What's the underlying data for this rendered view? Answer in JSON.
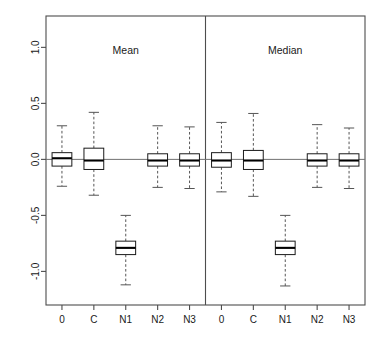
{
  "chart_data": {
    "type": "box",
    "title": "",
    "subtitle": "",
    "xlabel": "",
    "ylabel": "",
    "ylim": [
      -1.3,
      1.28
    ],
    "yticks": [
      1.0,
      0.5,
      0.0,
      -0.5,
      -1.0
    ],
    "ytick_labels": [
      "1.0",
      "0.5",
      "0.0",
      "-0.5",
      "-1.0"
    ],
    "grid": false,
    "legend": "none",
    "reference_line_y": 0.0,
    "panels": [
      {
        "label": "Mean",
        "categories": [
          "0",
          "C",
          "N1",
          "N2",
          "N3"
        ],
        "boxes": [
          {
            "category": "0",
            "whisker_low": -0.24,
            "q1": -0.06,
            "median": 0.01,
            "q3": 0.06,
            "whisker_high": 0.3
          },
          {
            "category": "C",
            "whisker_low": -0.32,
            "q1": -0.09,
            "median": -0.01,
            "q3": 0.1,
            "whisker_high": 0.42
          },
          {
            "category": "N1",
            "whisker_low": -1.12,
            "q1": -0.85,
            "median": -0.79,
            "q3": -0.73,
            "whisker_high": -0.5
          },
          {
            "category": "N2",
            "whisker_low": -0.25,
            "q1": -0.06,
            "median": -0.01,
            "q3": 0.05,
            "whisker_high": 0.3
          },
          {
            "category": "N3",
            "whisker_low": -0.26,
            "q1": -0.06,
            "median": -0.01,
            "q3": 0.05,
            "whisker_high": 0.29
          }
        ]
      },
      {
        "label": "Median",
        "categories": [
          "0",
          "C",
          "N1",
          "N2",
          "N3"
        ],
        "boxes": [
          {
            "category": "0",
            "whisker_low": -0.29,
            "q1": -0.07,
            "median": -0.01,
            "q3": 0.06,
            "whisker_high": 0.33
          },
          {
            "category": "C",
            "whisker_low": -0.33,
            "q1": -0.09,
            "median": -0.01,
            "q3": 0.08,
            "whisker_high": 0.41
          },
          {
            "category": "N1",
            "whisker_low": -1.13,
            "q1": -0.85,
            "median": -0.79,
            "q3": -0.73,
            "whisker_high": -0.5
          },
          {
            "category": "N2",
            "whisker_low": -0.25,
            "q1": -0.06,
            "median": -0.01,
            "q3": 0.05,
            "whisker_high": 0.31
          },
          {
            "category": "N3",
            "whisker_low": -0.26,
            "q1": -0.06,
            "median": -0.01,
            "q3": 0.05,
            "whisker_high": 0.28
          }
        ]
      }
    ],
    "colors": {
      "box_fill": "#ffffff",
      "box_stroke": "#1a1a1a",
      "median": "#000000",
      "whisker": "#555555",
      "frame": "#4d4d4d",
      "reference_line": "#707070",
      "text": "#1a1a1a",
      "background": "#ffffff"
    }
  }
}
